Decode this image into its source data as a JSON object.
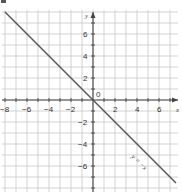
{
  "chart_data": {
    "type": "line",
    "title": "",
    "xlabel": "x",
    "ylabel": "y",
    "xlim": [
      -8,
      7.5
    ],
    "ylim": [
      -8.3,
      8.2
    ],
    "grid": true,
    "grid_step": 1,
    "x_ticks": [
      -8,
      -6,
      -4,
      -2,
      2,
      4,
      6
    ],
    "x_tick_labels": [
      "-8",
      "-6",
      "-4",
      "-2",
      "2",
      "4",
      "6"
    ],
    "y_ticks": [
      6,
      4,
      2,
      -2,
      -4,
      -6
    ],
    "y_tick_labels": [
      "6",
      "4",
      "2",
      "-2",
      "-4",
      "-6"
    ],
    "origin_label": "0",
    "series": [
      {
        "name": "y = -x",
        "equation": "y = -x",
        "x": [
          -8,
          7.5
        ],
        "y": [
          8,
          -7.5
        ],
        "color": "#555555"
      }
    ],
    "annotations": [
      {
        "text": "y = −x",
        "x": 5,
        "y": -5.5,
        "rotation": 45
      }
    ]
  },
  "labels": {
    "x_axis": "x",
    "y_axis": "y",
    "origin": "0",
    "line": "y = −x",
    "x_ticks": [
      "−8",
      "−6",
      "−4",
      "−2",
      "2",
      "4",
      "6"
    ],
    "y_ticks": [
      "6",
      "4",
      "2",
      "−2",
      "−4",
      "−6"
    ]
  }
}
